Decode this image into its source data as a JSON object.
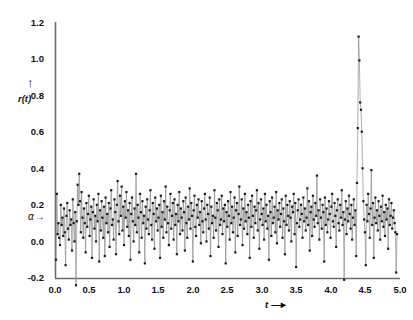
{
  "chart_data": {
    "type": "line",
    "title": "",
    "subtitle": "",
    "xlabel": "t",
    "ylabel": "r(t)",
    "xlabel_arrow": "→",
    "ylabel_arrow": "↑",
    "xlim": [
      0.0,
      5.0
    ],
    "ylim": [
      -0.2,
      1.2
    ],
    "grid": false,
    "legend": null,
    "marker": "square",
    "marker_color": "#1a1a1a",
    "line_color": "#8c8c8c",
    "axis_color": "#6b6b6b",
    "xticks": [
      "0.0",
      "0.5",
      "1.0",
      "1.5",
      "2.0",
      "2.5",
      "3.0",
      "3.5",
      "4.0",
      "4.5",
      "5.0"
    ],
    "xtick_values": [
      0.0,
      0.5,
      1.0,
      1.5,
      2.0,
      2.5,
      3.0,
      3.5,
      4.0,
      4.5,
      5.0
    ],
    "yticks": [
      "1.2",
      "1.0",
      "0.8",
      "0.6",
      "0.4",
      "0.2",
      "0.0",
      "-0.2"
    ],
    "ytick_values": [
      1.2,
      1.0,
      0.8,
      0.6,
      0.4,
      0.2,
      0.0,
      -0.2
    ],
    "annotations": [
      {
        "name": "alpha-level",
        "text": "α",
        "arrow": "→",
        "y_value": 0.1,
        "x_value": 0.0,
        "description": "mean level marker on y-axis"
      }
    ],
    "series": [
      {
        "name": "r(t)",
        "n_points": 431,
        "x_start": 0.0,
        "x_step": 0.01162,
        "baseline": 0.1,
        "peak": {
          "x": 4.3,
          "y": 1.12
        },
        "y": [
          -0.1,
          0.26,
          0.04,
          0.1,
          0.02,
          -0.02,
          0.2,
          0.09,
          0.13,
          0.03,
          0.18,
          0.05,
          -0.13,
          0.14,
          0.21,
          0.07,
          0.01,
          0.17,
          0.09,
          0.12,
          -0.05,
          0.23,
          0.1,
          0.0,
          0.16,
          -0.24,
          0.11,
          0.31,
          0.2,
          0.37,
          0.22,
          0.05,
          0.27,
          0.13,
          0.02,
          0.18,
          0.1,
          -0.06,
          0.21,
          0.08,
          0.15,
          0.25,
          0.03,
          0.12,
          0.19,
          -0.09,
          0.16,
          0.23,
          0.07,
          0.14,
          0.0,
          0.2,
          0.11,
          0.26,
          -0.11,
          0.17,
          0.06,
          0.22,
          0.13,
          0.02,
          0.19,
          -0.08,
          0.24,
          0.1,
          0.15,
          0.05,
          0.21,
          -0.03,
          0.18,
          0.28,
          0.09,
          0.12,
          0.01,
          0.23,
          0.16,
          -0.07,
          0.2,
          0.33,
          0.11,
          0.04,
          0.25,
          0.14,
          0.3,
          0.06,
          0.19,
          -0.02,
          0.22,
          0.13,
          0.27,
          0.08,
          0.17,
          0.03,
          0.21,
          -0.1,
          0.15,
          0.24,
          0.11,
          0.0,
          0.18,
          0.09,
          0.37,
          0.05,
          0.2,
          0.13,
          -0.06,
          0.26,
          0.16,
          0.02,
          0.22,
          0.1,
          0.14,
          -0.12,
          0.19,
          0.07,
          0.23,
          0.12,
          0.04,
          0.17,
          0.28,
          0.09,
          0.01,
          0.21,
          0.15,
          -0.04,
          0.24,
          0.11,
          0.18,
          0.06,
          0.13,
          0.2,
          -0.09,
          0.25,
          0.08,
          0.16,
          0.02,
          0.22,
          0.12,
          0.3,
          0.05,
          0.19,
          0.1,
          -0.02,
          0.17,
          0.26,
          0.07,
          0.14,
          0.21,
          0.01,
          0.23,
          0.09,
          0.15,
          -0.07,
          0.2,
          0.11,
          0.27,
          0.04,
          0.18,
          0.13,
          0.06,
          0.22,
          0.16,
          -0.05,
          0.24,
          0.1,
          0.02,
          0.19,
          0.12,
          0.29,
          0.07,
          0.21,
          0.14,
          -0.11,
          0.17,
          0.25,
          0.08,
          0.03,
          0.2,
          0.13,
          0.23,
          0.09,
          0.16,
          -0.01,
          0.22,
          0.11,
          0.05,
          0.18,
          0.26,
          0.12,
          0.0,
          0.2,
          0.15,
          0.07,
          0.24,
          -0.08,
          0.19,
          0.1,
          0.14,
          0.02,
          0.28,
          0.13,
          0.06,
          0.21,
          0.17,
          -0.03,
          0.23,
          0.09,
          0.12,
          0.25,
          0.04,
          0.18,
          0.11,
          0.2,
          -0.12,
          0.16,
          0.08,
          0.22,
          0.14,
          0.01,
          0.27,
          0.1,
          0.19,
          0.05,
          0.13,
          0.24,
          -0.06,
          0.17,
          0.21,
          0.03,
          0.15,
          0.3,
          0.09,
          0.12,
          0.23,
          -0.02,
          0.18,
          0.07,
          0.26,
          0.11,
          0.16,
          0.04,
          0.2,
          0.13,
          -0.09,
          0.22,
          0.08,
          0.25,
          0.14,
          0.02,
          0.19,
          0.1,
          0.17,
          0.28,
          0.06,
          0.21,
          -0.04,
          0.12,
          0.23,
          0.15,
          0.09,
          0.18,
          0.01,
          0.26,
          0.11,
          0.2,
          0.07,
          0.14,
          -0.1,
          0.22,
          0.16,
          0.03,
          0.24,
          0.1,
          0.13,
          0.19,
          0.05,
          0.27,
          -0.01,
          0.17,
          0.12,
          0.21,
          0.08,
          0.15,
          0.23,
          0.02,
          0.18,
          0.11,
          -0.07,
          0.25,
          0.09,
          0.2,
          0.14,
          0.06,
          0.22,
          0.13,
          0.0,
          0.19,
          0.16,
          0.26,
          0.04,
          0.21,
          -0.14,
          0.1,
          0.17,
          0.23,
          0.08,
          0.12,
          0.2,
          0.15,
          0.02,
          0.24,
          0.11,
          0.18,
          0.06,
          0.13,
          0.29,
          0.09,
          0.22,
          -0.05,
          0.16,
          0.19,
          0.03,
          0.25,
          0.12,
          0.08,
          0.21,
          0.14,
          0.36,
          0.1,
          0.17,
          0.01,
          0.23,
          0.13,
          0.07,
          0.2,
          0.16,
          -0.11,
          0.24,
          0.09,
          0.18,
          0.05,
          0.12,
          0.22,
          0.15,
          0.02,
          0.19,
          0.26,
          0.11,
          0.08,
          0.21,
          0.14,
          -0.03,
          0.17,
          0.23,
          0.1,
          0.06,
          0.2,
          0.13,
          0.28,
          0.09,
          0.16,
          -0.21,
          0.12,
          0.22,
          0.04,
          0.18,
          0.11,
          0.25,
          0.15,
          0.07,
          0.2,
          0.01,
          0.13,
          0.23,
          0.09,
          0.17,
          -0.08,
          0.32,
          0.62,
          1.12,
          0.99,
          0.76,
          0.72,
          0.6,
          0.4,
          0.22,
          0.12,
          0.05,
          -0.13,
          0.2,
          0.11,
          0.26,
          0.15,
          0.02,
          0.18,
          0.39,
          0.09,
          0.21,
          -0.09,
          0.13,
          0.24,
          0.1,
          0.17,
          0.06,
          0.22,
          0.14,
          0.01,
          0.19,
          0.11,
          0.25,
          0.08,
          0.16,
          0.03,
          0.2,
          0.12,
          0.18,
          -0.04,
          0.23,
          0.09,
          0.14,
          0.21,
          0.07,
          0.13,
          0.17,
          0.1,
          0.05,
          -0.17,
          0.04
        ]
      }
    ]
  },
  "axes": {
    "y_title": "r(t)",
    "x_title": "t"
  }
}
